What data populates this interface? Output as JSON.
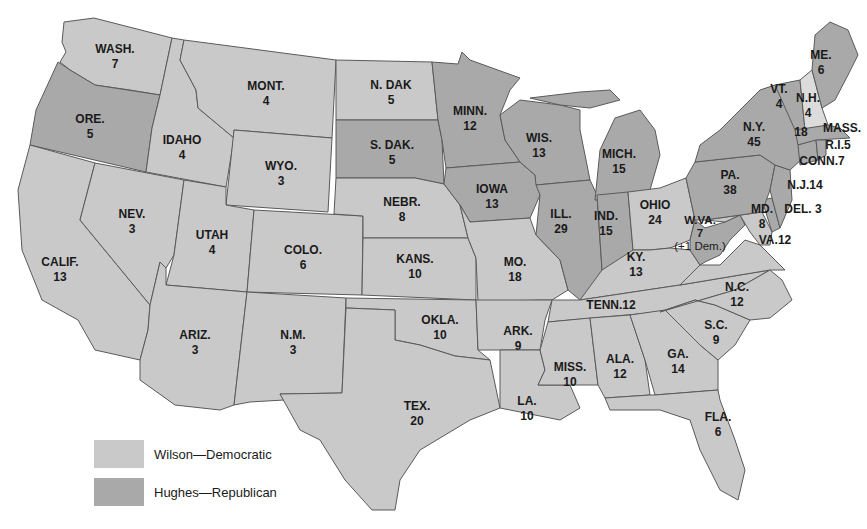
{
  "map": {
    "title": "",
    "colors": {
      "democratic": "#c9c9c9",
      "republican": "#a9a9a9",
      "new_hampshire": "#dcdcdc",
      "border": "#5a5a5a"
    }
  },
  "legend": {
    "items": [
      {
        "label": "Wilson—Democratic",
        "color": "#c9c9c9"
      },
      {
        "label": "Hughes—Republican",
        "color": "#a9a9a9"
      }
    ]
  },
  "states": {
    "wash": {
      "abbr": "WASH.",
      "votes": "7",
      "party": "dem"
    },
    "ore": {
      "abbr": "ORE.",
      "votes": "5",
      "party": "rep"
    },
    "calif": {
      "abbr": "CALIF.",
      "votes": "13",
      "party": "dem"
    },
    "idaho": {
      "abbr": "IDAHO",
      "votes": "4",
      "party": "dem"
    },
    "nev": {
      "abbr": "NEV.",
      "votes": "3",
      "party": "dem"
    },
    "mont": {
      "abbr": "MONT.",
      "votes": "4",
      "party": "dem"
    },
    "wyo": {
      "abbr": "WYO.",
      "votes": "3",
      "party": "dem"
    },
    "utah": {
      "abbr": "UTAH",
      "votes": "4",
      "party": "dem"
    },
    "colo": {
      "abbr": "COLO.",
      "votes": "6",
      "party": "dem"
    },
    "ariz": {
      "abbr": "ARIZ.",
      "votes": "3",
      "party": "dem"
    },
    "nm": {
      "abbr": "N.M.",
      "votes": "3",
      "party": "dem"
    },
    "ndak": {
      "abbr": "N. DAK",
      "votes": "5",
      "party": "dem"
    },
    "sdak": {
      "abbr": "S. DAK.",
      "votes": "5",
      "party": "rep"
    },
    "nebr": {
      "abbr": "NEBR.",
      "votes": "8",
      "party": "dem"
    },
    "kans": {
      "abbr": "KANS.",
      "votes": "10",
      "party": "dem"
    },
    "okla": {
      "abbr": "OKLA.",
      "votes": "10",
      "party": "dem"
    },
    "tex": {
      "abbr": "TEX.",
      "votes": "20",
      "party": "dem"
    },
    "minn": {
      "abbr": "MINN.",
      "votes": "12",
      "party": "rep"
    },
    "iowa": {
      "abbr": "IOWA",
      "votes": "13",
      "party": "rep"
    },
    "mo": {
      "abbr": "MO.",
      "votes": "18",
      "party": "dem"
    },
    "ark": {
      "abbr": "ARK.",
      "votes": "9",
      "party": "dem"
    },
    "la": {
      "abbr": "LA.",
      "votes": "10",
      "party": "dem"
    },
    "wis": {
      "abbr": "WIS.",
      "votes": "13",
      "party": "rep"
    },
    "ill": {
      "abbr": "ILL.",
      "votes": "29",
      "party": "rep"
    },
    "mich": {
      "abbr": "MICH.",
      "votes": "15",
      "party": "rep"
    },
    "ind": {
      "abbr": "IND.",
      "votes": "15",
      "party": "rep"
    },
    "ohio": {
      "abbr": "OHIO",
      "votes": "24",
      "party": "dem"
    },
    "ky": {
      "abbr": "KY.",
      "votes": "13",
      "party": "dem"
    },
    "tenn": {
      "abbr": "TENN.",
      "votes": "12",
      "party": "dem"
    },
    "miss": {
      "abbr": "MISS.",
      "votes": "10",
      "party": "dem"
    },
    "ala": {
      "abbr": "ALA.",
      "votes": "12",
      "party": "dem"
    },
    "ga": {
      "abbr": "GA.",
      "votes": "14",
      "party": "dem"
    },
    "fla": {
      "abbr": "FLA.",
      "votes": "6",
      "party": "dem"
    },
    "sc": {
      "abbr": "S.C.",
      "votes": "9",
      "party": "dem"
    },
    "nc": {
      "abbr": "N.C.",
      "votes": "12",
      "party": "dem"
    },
    "va": {
      "abbr": "VA.",
      "votes": "12",
      "party": "dem"
    },
    "wva": {
      "abbr": "W.VA.",
      "votes": "7",
      "note": "(+1 Dem.)",
      "party": "rep"
    },
    "md": {
      "abbr": "MD.",
      "votes": "8",
      "party": "dem"
    },
    "del": {
      "abbr": "DEL.",
      "votes": "3",
      "party": "rep"
    },
    "pa": {
      "abbr": "PA.",
      "votes": "38",
      "party": "rep"
    },
    "nj": {
      "abbr": "N.J.",
      "votes": "14",
      "party": "rep"
    },
    "ny": {
      "abbr": "N.Y.",
      "votes": "45",
      "party": "rep"
    },
    "vt": {
      "abbr": "VT.",
      "votes": "4",
      "party": "rep"
    },
    "nh": {
      "abbr": "N.H.",
      "votes": "4",
      "party": "dem"
    },
    "me": {
      "abbr": "ME.",
      "votes": "6",
      "party": "rep"
    },
    "mass": {
      "abbr": "MASS.",
      "votes": "18",
      "party": "rep"
    },
    "ri": {
      "abbr": "R.I.",
      "votes": "5",
      "party": "rep"
    },
    "conn": {
      "abbr": "CONN.",
      "votes": "7",
      "party": "rep"
    }
  }
}
